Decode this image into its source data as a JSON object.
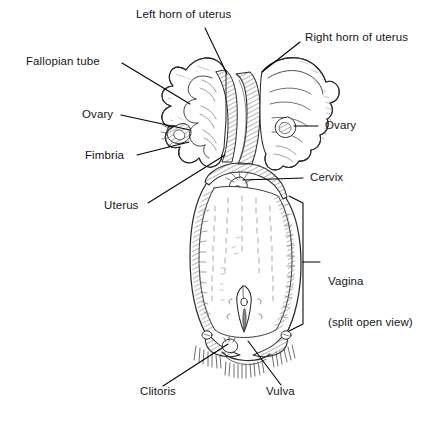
{
  "figure": {
    "background_color": "#ffffff",
    "ink_color": "#1a1a1a",
    "line_color": "#000000"
  },
  "labels": {
    "left_horn": "Left horn of uterus",
    "right_horn": "Right horn of uterus",
    "fallopian_tube": "Fallopian tube",
    "ovary_left": "Ovary",
    "ovary_right": "Ovary",
    "fimbria": "Fimbria",
    "cervix": "Cervix",
    "uterus": "Uterus",
    "vagina_line1": "Vagina",
    "vagina_line2": "(split open view)",
    "clitoris": "Clitoris",
    "vulva": "Vulva"
  },
  "callouts": [
    {
      "id": "left-horn-of-uterus",
      "text": "Left horn of uterus",
      "text_x": 136,
      "text_y": 13,
      "leader": [
        [
          205,
          28
        ],
        [
          227,
          74
        ]
      ]
    },
    {
      "id": "right-horn-of-uterus",
      "text": "Right horn of uterus",
      "text_x": 305,
      "text_y": 36,
      "leader": [
        [
          300,
          42
        ],
        [
          262,
          72
        ]
      ]
    },
    {
      "id": "fallopian-tube",
      "text": "Fallopian tube",
      "text_x": 26,
      "text_y": 58,
      "leader": [
        [
          122,
          63
        ],
        [
          190,
          104
        ]
      ]
    },
    {
      "id": "ovary-left",
      "text": "Ovary",
      "text_x": 82,
      "text_y": 110,
      "leader": [
        [
          121,
          115
        ],
        [
          190,
          130
        ]
      ]
    },
    {
      "id": "ovary-right",
      "text": "Ovary",
      "text_x": 325,
      "text_y": 120,
      "leader": [
        [
          288,
          126
        ],
        [
          318,
          126
        ]
      ]
    },
    {
      "id": "fimbria",
      "text": "Fimbria",
      "text_x": 85,
      "text_y": 152,
      "leader": [
        [
          137,
          155
        ],
        [
          189,
          142
        ]
      ]
    },
    {
      "id": "cervix",
      "text": "Cervix",
      "text_x": 310,
      "text_y": 172,
      "leader": [
        [
          243,
          180
        ],
        [
          303,
          178
        ]
      ]
    },
    {
      "id": "uterus",
      "text": "Uterus",
      "text_x": 104,
      "text_y": 201,
      "leader": [
        [
          148,
          203
        ],
        [
          225,
          155
        ]
      ]
    },
    {
      "id": "vagina",
      "text": "Vagina",
      "text_x": 328,
      "text_y": 251,
      "leader": [
        [
          304,
          262
        ],
        [
          320,
          262
        ]
      ]
    },
    {
      "id": "clitoris",
      "text": "Clitoris",
      "text_x": 140,
      "text_y": 388,
      "leader": [
        [
          163,
          386
        ],
        [
          224,
          345
        ]
      ]
    },
    {
      "id": "vulva",
      "text": "Vulva",
      "text_x": 266,
      "text_y": 388,
      "leader": [
        [
          281,
          385
        ],
        [
          247,
          341
        ]
      ]
    }
  ],
  "bracket": {
    "id": "vagina-bracket",
    "x": 303,
    "top_y": 196,
    "bottom_y": 330,
    "arm_x": 289,
    "tick_y": 262,
    "tick_x_end": 320
  },
  "anatomy_parts": [
    "left-horn-of-uterus",
    "right-horn-of-uterus",
    "fallopian-tube",
    "ovary-left",
    "ovary-right",
    "fimbria",
    "uterus-body",
    "cervix",
    "vagina",
    "clitoris",
    "vulva"
  ]
}
